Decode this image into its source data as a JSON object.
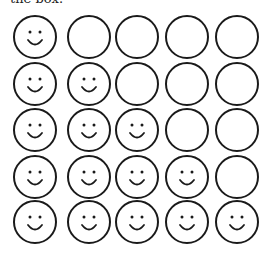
{
  "header": {
    "cropped_text": "the box."
  },
  "grid": {
    "rows": 5,
    "cols": 5,
    "col_centers": [
      35,
      89,
      137,
      187,
      237
    ],
    "row_centers": [
      37,
      84,
      130,
      177,
      222
    ],
    "radius": 21,
    "stroke_color": "#1a1a1a",
    "faces_per_row": [
      1,
      2,
      3,
      4,
      5
    ]
  }
}
